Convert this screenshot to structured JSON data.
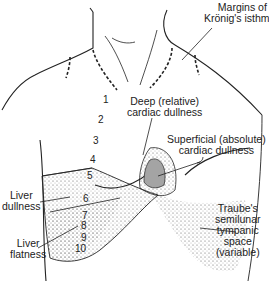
{
  "labels": {
    "kronig": [
      "Margins of",
      "Krönig's isthmus"
    ],
    "deep": [
      "Deep (relative)",
      "cardiac dullness"
    ],
    "superficial": [
      "Superficial (absolute)",
      "cardiac dullness"
    ],
    "liver_dullness": [
      "Liver",
      "dullness"
    ],
    "liver_flatness": [
      "Liver",
      "flatness"
    ],
    "traube": [
      "Traube's",
      "semilunar",
      "tympanic",
      "space",
      "(variable)"
    ]
  },
  "ribs": [
    "1",
    "2",
    "3",
    "4",
    "5",
    "6",
    "7",
    "8",
    "9",
    "10"
  ]
}
